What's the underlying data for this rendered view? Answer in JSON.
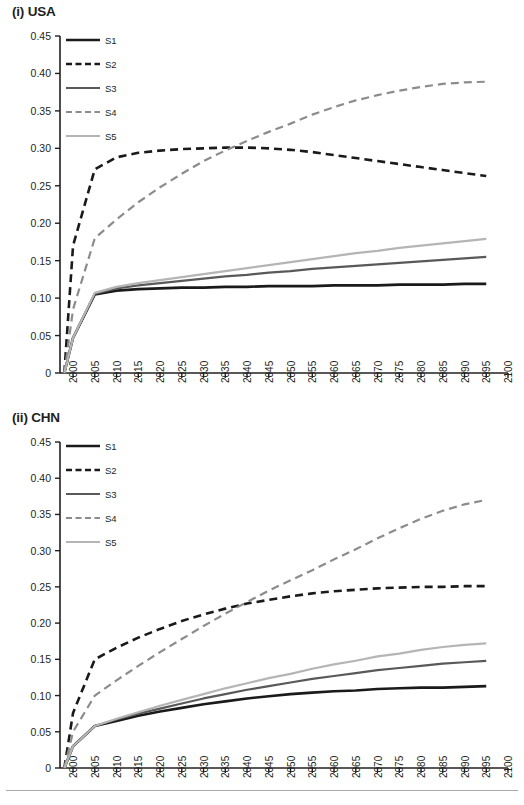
{
  "figure": {
    "panels": [
      {
        "id": "usa",
        "title": "(i) USA"
      },
      {
        "id": "chn",
        "title": "(ii) CHN"
      }
    ],
    "series_colors": {
      "S1": "#1a1a1a",
      "S2": "#1a1a1a",
      "S3": "#595959",
      "S4": "#8c8c8c",
      "S5": "#b5b5b5"
    }
  },
  "legend": {
    "items": [
      {
        "label": "S1",
        "style": "solid",
        "color": "#1a1a1a",
        "width": 2.6
      },
      {
        "label": "S2",
        "style": "dashed",
        "color": "#1a1a1a",
        "width": 2.6
      },
      {
        "label": "S3",
        "style": "solid",
        "color": "#595959",
        "width": 2.2
      },
      {
        "label": "S4",
        "style": "dashed",
        "color": "#8c8c8c",
        "width": 2.2
      },
      {
        "label": "S5",
        "style": "solid",
        "color": "#b5b5b5",
        "width": 2.2
      }
    ]
  },
  "chart_data": [
    {
      "type": "line",
      "title": "(i) USA",
      "xlabel": "",
      "ylabel": "",
      "xlim": [
        1997,
        2100
      ],
      "ylim": [
        0,
        0.45
      ],
      "grid": false,
      "legend_position": "top-left-inside",
      "xticklabels": [
        "2000",
        "2005",
        "2010",
        "2015",
        "2020",
        "2025",
        "2030",
        "2035",
        "2040",
        "2045",
        "2050",
        "2055",
        "2060",
        "2065",
        "2070",
        "2075",
        "2080",
        "2085",
        "2090",
        "2095",
        "2100"
      ],
      "yticklabels": [
        "0",
        "0.05",
        "0.10",
        "0.15",
        "0.20",
        "0.25",
        "0.30",
        "0.35",
        "0.40",
        "0.45"
      ],
      "x": [
        1998,
        2000,
        2005,
        2010,
        2015,
        2020,
        2025,
        2030,
        2035,
        2040,
        2045,
        2050,
        2055,
        2060,
        2065,
        2070,
        2075,
        2080,
        2085,
        2090,
        2095
      ],
      "series": [
        {
          "name": "S1",
          "values": [
            0,
            0.047,
            0.105,
            0.11,
            0.112,
            0.113,
            0.114,
            0.114,
            0.115,
            0.115,
            0.116,
            0.116,
            0.116,
            0.117,
            0.117,
            0.117,
            0.118,
            0.118,
            0.118,
            0.119,
            0.119
          ]
        },
        {
          "name": "S2",
          "values": [
            0,
            0.17,
            0.272,
            0.288,
            0.294,
            0.297,
            0.299,
            0.3,
            0.301,
            0.301,
            0.3,
            0.298,
            0.295,
            0.291,
            0.287,
            0.283,
            0.279,
            0.275,
            0.271,
            0.267,
            0.263
          ]
        },
        {
          "name": "S3",
          "values": [
            0,
            0.047,
            0.106,
            0.113,
            0.117,
            0.12,
            0.123,
            0.126,
            0.129,
            0.131,
            0.134,
            0.136,
            0.139,
            0.141,
            0.143,
            0.145,
            0.147,
            0.149,
            0.151,
            0.153,
            0.155
          ]
        },
        {
          "name": "S4",
          "values": [
            0,
            0.085,
            0.18,
            0.205,
            0.228,
            0.248,
            0.266,
            0.283,
            0.297,
            0.31,
            0.322,
            0.333,
            0.345,
            0.355,
            0.364,
            0.371,
            0.377,
            0.382,
            0.386,
            0.388,
            0.389
          ]
        },
        {
          "name": "S5",
          "values": [
            0,
            0.047,
            0.107,
            0.115,
            0.12,
            0.124,
            0.128,
            0.132,
            0.136,
            0.14,
            0.144,
            0.148,
            0.152,
            0.156,
            0.16,
            0.163,
            0.167,
            0.17,
            0.173,
            0.176,
            0.179
          ]
        }
      ]
    },
    {
      "type": "line",
      "title": "(ii) CHN",
      "xlabel": "",
      "ylabel": "",
      "xlim": [
        1997,
        2100
      ],
      "ylim": [
        0,
        0.45
      ],
      "grid": false,
      "legend_position": "top-left-inside",
      "xticklabels": [
        "2000",
        "2005",
        "2010",
        "2015",
        "2020",
        "2025",
        "2030",
        "2035",
        "2040",
        "2045",
        "2050",
        "2055",
        "2060",
        "2065",
        "2070",
        "2075",
        "2080",
        "2085",
        "2090",
        "2095",
        "2100"
      ],
      "yticklabels": [
        "0",
        "0.05",
        "0.10",
        "0.15",
        "0.20",
        "0.25",
        "0.30",
        "0.35",
        "0.40",
        "0.45"
      ],
      "x": [
        1998,
        2000,
        2005,
        2010,
        2015,
        2020,
        2025,
        2030,
        2035,
        2040,
        2045,
        2050,
        2055,
        2060,
        2065,
        2070,
        2075,
        2080,
        2085,
        2090,
        2095
      ],
      "series": [
        {
          "name": "S1",
          "values": [
            0,
            0.03,
            0.058,
            0.065,
            0.072,
            0.078,
            0.083,
            0.088,
            0.092,
            0.096,
            0.099,
            0.102,
            0.104,
            0.106,
            0.107,
            0.109,
            0.11,
            0.111,
            0.111,
            0.112,
            0.113
          ]
        },
        {
          "name": "S2",
          "values": [
            0,
            0.076,
            0.15,
            0.166,
            0.18,
            0.192,
            0.203,
            0.212,
            0.22,
            0.227,
            0.232,
            0.237,
            0.241,
            0.244,
            0.246,
            0.248,
            0.249,
            0.25,
            0.25,
            0.251,
            0.251
          ]
        },
        {
          "name": "S3",
          "values": [
            0,
            0.03,
            0.058,
            0.067,
            0.075,
            0.082,
            0.089,
            0.096,
            0.102,
            0.108,
            0.113,
            0.118,
            0.123,
            0.127,
            0.131,
            0.135,
            0.138,
            0.141,
            0.144,
            0.146,
            0.148
          ]
        },
        {
          "name": "S4",
          "values": [
            0,
            0.05,
            0.1,
            0.121,
            0.141,
            0.16,
            0.178,
            0.196,
            0.213,
            0.229,
            0.245,
            0.259,
            0.273,
            0.288,
            0.302,
            0.317,
            0.331,
            0.344,
            0.355,
            0.364,
            0.37
          ]
        },
        {
          "name": "S5",
          "values": [
            0,
            0.03,
            0.058,
            0.068,
            0.077,
            0.086,
            0.094,
            0.102,
            0.11,
            0.117,
            0.124,
            0.13,
            0.137,
            0.143,
            0.148,
            0.154,
            0.158,
            0.163,
            0.167,
            0.17,
            0.172
          ]
        }
      ]
    }
  ]
}
